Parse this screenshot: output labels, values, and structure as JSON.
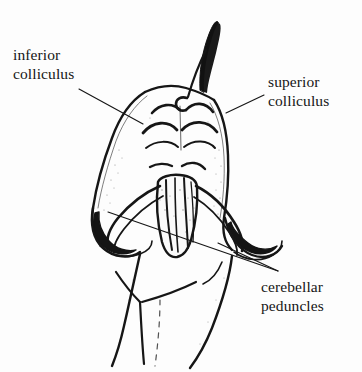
{
  "figure": {
    "background_color": "#fdfdfd",
    "ink_color": "#161616",
    "width": 362,
    "height": 372
  },
  "labels": {
    "inferior_colliculus": {
      "line1": "inferior",
      "line2": "colliculus"
    },
    "superior_colliculus": {
      "line1": "superior",
      "line2": "colliculus"
    },
    "cerebellar_peduncles": {
      "line1": "cerebellar",
      "line2": "peduncles"
    }
  },
  "leader_lines": [
    {
      "name": "inferior-colliculus-leader",
      "from": [
        79,
        89
      ],
      "to": [
        143,
        124
      ]
    },
    {
      "name": "superior-colliculus-leader",
      "from": [
        264,
        95
      ],
      "to": [
        226,
        113
      ]
    },
    {
      "name": "cerebellar-peduncle-leader-left",
      "from": [
        108,
        212
      ],
      "to": [
        278,
        271
      ]
    },
    {
      "name": "cerebellar-peduncle-leader-right",
      "from": [
        218,
        243
      ],
      "to": [
        278,
        271
      ]
    }
  ]
}
